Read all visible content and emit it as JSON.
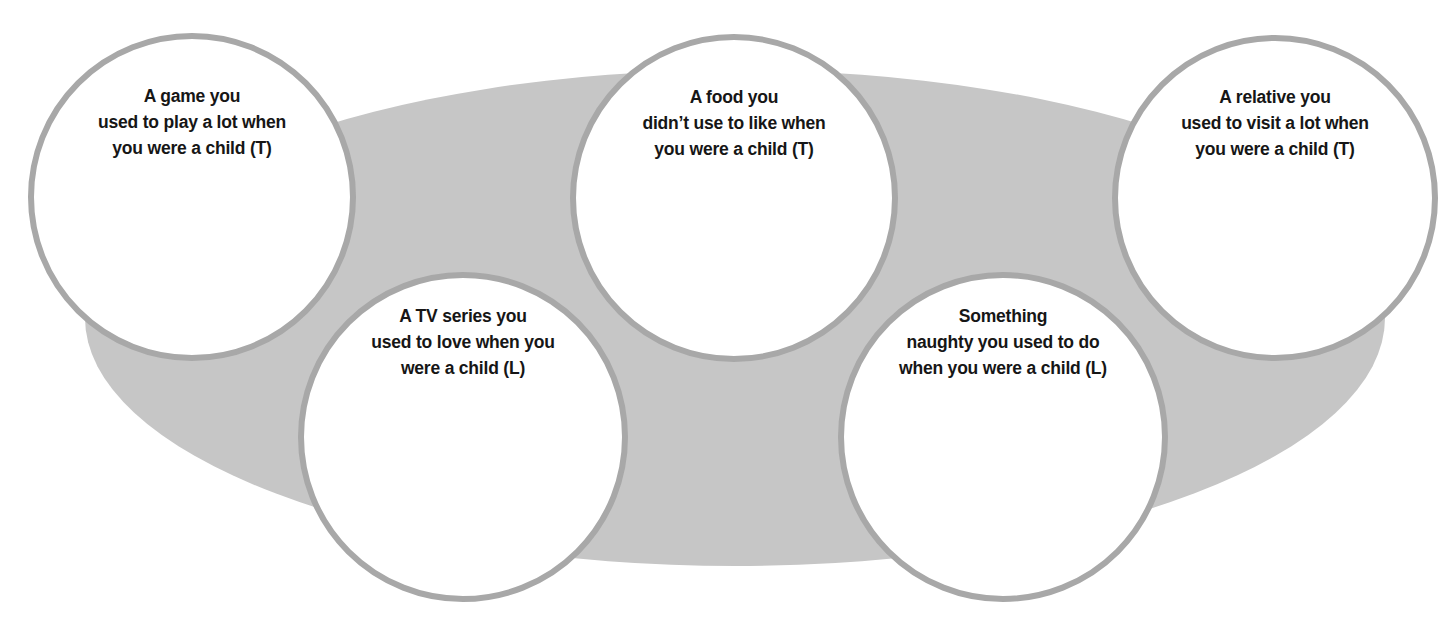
{
  "diagram": {
    "type": "speaking-activity-bubbles",
    "colors": {
      "background": "#ffffff",
      "ellipse_fill": "#c6c6c6",
      "bubble_fill": "#ffffff",
      "bubble_border": "#a8a8a8",
      "text": "#161616"
    },
    "ellipse": {
      "cx": 735,
      "cy": 318,
      "rx": 650,
      "ry": 248
    },
    "bubbles": [
      {
        "id": "game",
        "cx": 192,
        "cy": 197,
        "r": 164,
        "lines": [
          "A game you",
          "used to play a lot when",
          "you were a child (T)"
        ]
      },
      {
        "id": "tv-series",
        "cx": 463,
        "cy": 437,
        "r": 165,
        "lines": [
          "A TV series you",
          "used to love when you",
          "were a child (L)"
        ]
      },
      {
        "id": "food",
        "cx": 734,
        "cy": 198,
        "r": 164,
        "lines": [
          "A food you",
          "didn’t use to like when",
          "you were a child (T)"
        ]
      },
      {
        "id": "naughty",
        "cx": 1003,
        "cy": 437,
        "r": 165,
        "lines": [
          "Something",
          "naughty you used to do",
          "when you were a child (L)"
        ]
      },
      {
        "id": "relative",
        "cx": 1275,
        "cy": 198,
        "r": 163,
        "lines": [
          "A relative you",
          "used to visit a lot when",
          "you were a child (T)"
        ]
      }
    ]
  }
}
